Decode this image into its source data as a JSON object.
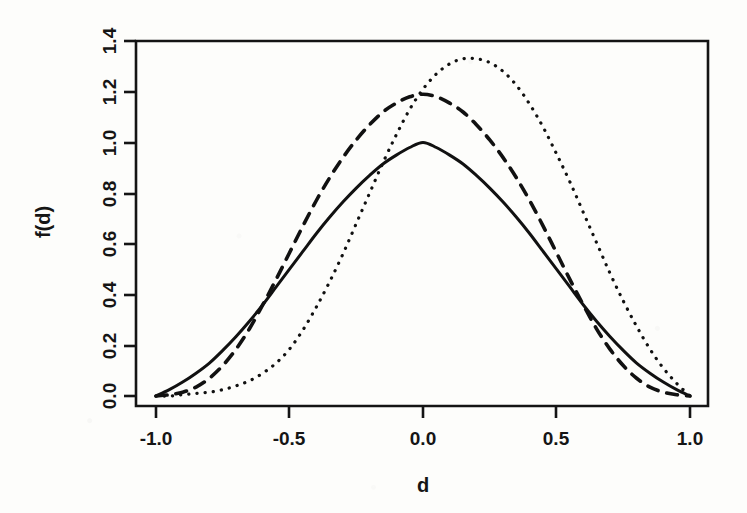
{
  "figure": {
    "title": "",
    "background_color": "#fdfdfb",
    "ink_color": "#111111"
  },
  "axes": {
    "x_label": "d",
    "y_label": "f(d)",
    "x_ticks": [
      "-1.0",
      "-0.5",
      "0.0",
      "0.5",
      "1.0"
    ],
    "y_ticks": [
      "0.0",
      "0.2",
      "0.4",
      "0.6",
      "0.8",
      "1.0",
      "1.2",
      "1.4"
    ]
  },
  "chart_data": {
    "type": "line",
    "title": "",
    "subtitle": "",
    "xlabel": "d",
    "ylabel": "f(d)",
    "xlim": [
      -1.0,
      1.0
    ],
    "ylim": [
      0.0,
      1.4
    ],
    "xticks": [
      -1.0,
      -0.5,
      0.0,
      0.5,
      1.0
    ],
    "yticks": [
      0.0,
      0.2,
      0.4,
      0.6,
      0.8,
      1.0,
      1.2,
      1.4
    ],
    "grid": false,
    "legend": "none",
    "box_frame": true,
    "x": [
      -1.0,
      -0.95,
      -0.9,
      -0.85,
      -0.8,
      -0.75,
      -0.7,
      -0.65,
      -0.6,
      -0.55,
      -0.5,
      -0.45,
      -0.4,
      -0.35,
      -0.3,
      -0.25,
      -0.2,
      -0.15,
      -0.1,
      -0.05,
      0.0,
      0.05,
      0.1,
      0.15,
      0.2,
      0.25,
      0.3,
      0.35,
      0.4,
      0.45,
      0.5,
      0.55,
      0.6,
      0.65,
      0.7,
      0.75,
      0.8,
      0.85,
      0.9,
      0.95,
      1.0
    ],
    "series": [
      {
        "name": "solid",
        "line_style": "solid",
        "color": "#111111",
        "peak_x": 0.0,
        "peak_y": 1.0,
        "values": [
          0.0,
          0.025,
          0.055,
          0.09,
          0.13,
          0.18,
          0.235,
          0.295,
          0.36,
          0.43,
          0.5,
          0.57,
          0.64,
          0.705,
          0.765,
          0.82,
          0.87,
          0.915,
          0.95,
          0.98,
          1.0,
          0.98,
          0.95,
          0.915,
          0.87,
          0.82,
          0.765,
          0.705,
          0.64,
          0.57,
          0.5,
          0.43,
          0.36,
          0.295,
          0.235,
          0.18,
          0.13,
          0.09,
          0.055,
          0.025,
          0.0
        ]
      },
      {
        "name": "dashed",
        "line_style": "dashed",
        "color": "#111111",
        "peak_x": 0.0,
        "peak_y": 1.19,
        "values": [
          0.0,
          0.005,
          0.015,
          0.035,
          0.07,
          0.12,
          0.185,
          0.265,
          0.36,
          0.46,
          0.565,
          0.67,
          0.77,
          0.86,
          0.94,
          1.01,
          1.07,
          1.12,
          1.155,
          1.18,
          1.19,
          1.18,
          1.155,
          1.12,
          1.07,
          1.01,
          0.94,
          0.86,
          0.77,
          0.67,
          0.565,
          0.46,
          0.36,
          0.265,
          0.185,
          0.12,
          0.07,
          0.035,
          0.015,
          0.005,
          0.0
        ]
      },
      {
        "name": "dotted",
        "line_style": "dotted",
        "color": "#111111",
        "peak_x": 0.23,
        "peak_y": 1.33,
        "values": [
          0.0,
          0.0,
          0.005,
          0.01,
          0.015,
          0.025,
          0.04,
          0.06,
          0.09,
          0.13,
          0.185,
          0.26,
          0.35,
          0.45,
          0.56,
          0.68,
          0.8,
          0.92,
          1.03,
          1.13,
          1.21,
          1.27,
          1.31,
          1.33,
          1.33,
          1.315,
          1.28,
          1.225,
          1.15,
          1.06,
          0.955,
          0.845,
          0.725,
          0.605,
          0.485,
          0.375,
          0.275,
          0.185,
          0.11,
          0.05,
          0.0
        ]
      }
    ]
  }
}
